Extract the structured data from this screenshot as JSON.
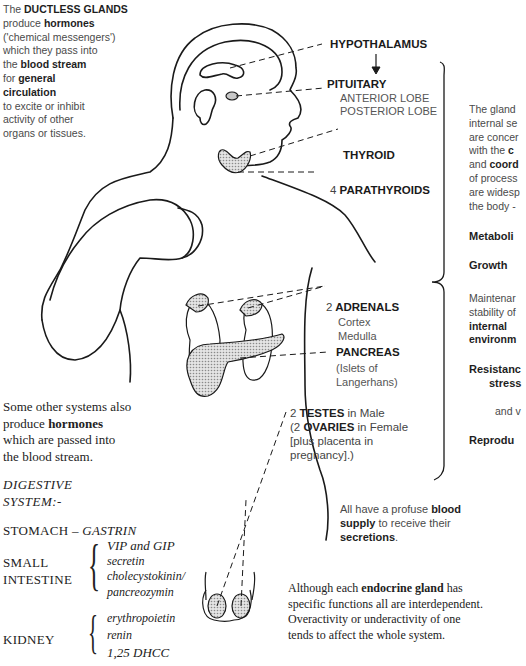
{
  "intro": {
    "line1_prefix": "The ",
    "line1_bold": "DUCTLESS GLANDS",
    "line2_prefix": "produce ",
    "line2_bold": "hormones",
    "line3": "('chemical messengers')",
    "line4": "which they pass into",
    "line5_prefix": "the ",
    "line5_bold": "blood stream",
    "line6_prefix": "for ",
    "line6_bold": "general",
    "line7_bold": "circulation",
    "line8": "to excite or inhibit",
    "line9": "activity of other",
    "line10": "organs or tissues."
  },
  "glands": {
    "hypothalamus": "HYPOTHALAMUS",
    "arrow": "↓",
    "pituitary": "PITUITARY",
    "anterior_lobe": "ANTERIOR LOBE",
    "posterior_lobe": "POSTERIOR LOBE",
    "thyroid": "THYROID",
    "parathyroids_count": "4",
    "parathyroids": "PARATHYROIDS",
    "adrenals_count": "2",
    "adrenals": "ADRENALS",
    "cortex": "Cortex",
    "medulla": "Medulla",
    "pancreas": "PANCREAS",
    "islets1": "(Islets of",
    "islets2": "Langerhans)",
    "testes_count": "2",
    "testes": "TESTES",
    "testes_suffix": " in Male",
    "ovaries_prefix": "(2 ",
    "ovaries": "OVARIES",
    "ovaries_suffix": " in Female",
    "placenta1": "[plus placenta in",
    "placenta2": "pregnancy].)"
  },
  "right_panel": {
    "para_line1": "The gland",
    "para_line2": "internal se",
    "para_line3": "are concer",
    "para_line4_prefix": "with the ",
    "para_line4_bold": "c",
    "para_line5_prefix": "and ",
    "para_line5_bold": "coord",
    "para_line6": "of process",
    "para_line7": "are widesp",
    "para_line8": "the body -",
    "metabolism": "Metaboli",
    "growth": "Growth",
    "maint_line1": "Maintenar",
    "maint_line2": "stability of",
    "maint_line3": "internal",
    "maint_line4": "environm",
    "resist_line1": "Resistanc",
    "resist_line2": "stress",
    "resist_line3": "and v",
    "reproduction": "Reprodu"
  },
  "blood_supply": {
    "prefix": "All have a profuse ",
    "bold1": "blood",
    "bold2": "supply",
    "middle": " to receive their",
    "bold3": "secretions",
    "suffix": "."
  },
  "other_systems": {
    "line1": "Some other systems also",
    "line2_prefix": "produce ",
    "line2_bold": "hormones",
    "line3": "which are passed into",
    "line4": "the blood stream.",
    "heading1": "DIGESTIVE",
    "heading2": "SYSTEM:-",
    "stomach": "STOMACH – ",
    "gastrin": "GASTRIN",
    "small_intestine1": "SMALL",
    "small_intestine2": "INTESTINE",
    "si_hormones": [
      "VIP and GIP",
      "secretin",
      "cholecystokinin/",
      "pancreozymin"
    ],
    "kidney": "KIDNEY",
    "kidney_hormones": [
      "erythropoietin",
      "renin",
      "1,25 DHCC"
    ]
  },
  "footer": {
    "prefix": "Although each ",
    "bold": "endocrine gland",
    "line1_suffix": " has",
    "line2": "specific functions all are interdependent.",
    "line3": "Overactivity or underactivity of one",
    "line4": "tends to affect the whole system."
  },
  "colors": {
    "ink": "#1a1a1a",
    "gland_fill": "#c8c8c8",
    "background": "#ffffff"
  }
}
